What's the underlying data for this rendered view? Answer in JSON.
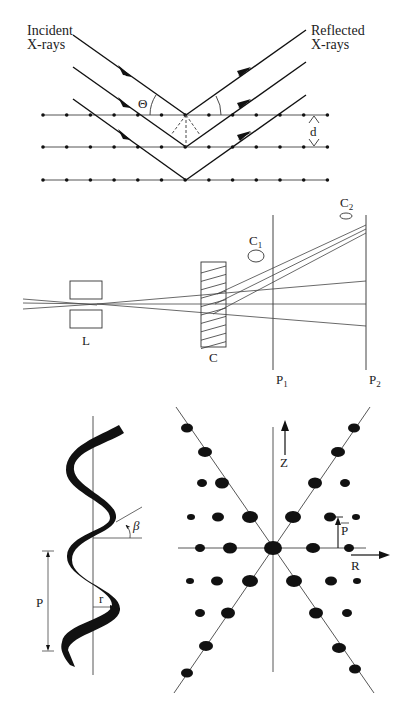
{
  "panels": {
    "bragg": {
      "title": "Bragg reflection from lattice planes",
      "incident_label_line1": "Incident",
      "incident_label_line2": "X-rays",
      "reflected_label_line1": "Reflected",
      "reflected_label_line2": "X-rays",
      "angle_label": "Θ",
      "spacing_label": "d",
      "planes": 3,
      "atoms_per_plane": 13
    },
    "apparatus": {
      "title": "Diffraction apparatus",
      "lens_label": "L",
      "crystal_label": "C",
      "plate1_label": "P",
      "plate1_sub": "1",
      "plate2_label": "P",
      "plate2_sub": "2",
      "spot1_label": "C",
      "spot1_sub": "1",
      "spot2_label": "C",
      "spot2_sub": "2"
    },
    "helix": {
      "title": "Helix geometry",
      "pitch_label": "P",
      "radius_label": "r",
      "angle_label": "β"
    },
    "pattern": {
      "title": "Helical diffraction X-pattern",
      "z_axis_label": "Z",
      "r_axis_label": "R",
      "p_vector_label": "P̄",
      "p_vector_main": "P"
    }
  },
  "colors": {
    "ink": "#111111",
    "line": "#444444",
    "background": "#ffffff"
  }
}
